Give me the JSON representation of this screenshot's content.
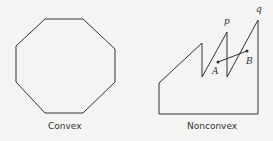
{
  "figure": {
    "convex": {
      "caption": "Convex",
      "shape": "octagon",
      "points": "45,19 83,19 115,49 115,82 83,113 45,113 16,82 16,46"
    },
    "nonconvex": {
      "caption": "Nonconvex",
      "points": "159,114 159,83 202,43 202,77 227,32 227,77 258,20 258,114",
      "segment": {
        "A": [
          218,
          62
        ],
        "B": [
          247,
          51
        ]
      },
      "labels": {
        "p": "p",
        "q": "q",
        "A": "A",
        "B": "B"
      }
    },
    "stroke_color": "#333333"
  }
}
